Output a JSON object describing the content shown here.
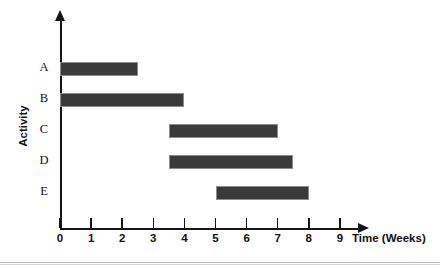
{
  "chart_data": {
    "type": "bar",
    "orientation": "horizontal",
    "subtype": "gantt",
    "title": "",
    "xlabel": "Time (Weeks)",
    "ylabel": "Activity",
    "xlim": [
      0,
      9.6
    ],
    "ylim": [
      0,
      5
    ],
    "grid": false,
    "legend": null,
    "xticks": [
      0,
      1,
      2,
      3,
      4,
      5,
      6,
      7,
      8,
      9
    ],
    "xtick_labels": [
      "0",
      "1",
      "2",
      "3",
      "4",
      "5",
      "6",
      "7",
      "8",
      "9"
    ],
    "categories": [
      "A",
      "B",
      "C",
      "D",
      "E"
    ],
    "bar_color": "#3a3a3a",
    "bar_edge_color": "#8c8c8c",
    "axis_color": "#141414",
    "tasks": [
      {
        "activity": "A",
        "start": 0,
        "end": 2.5,
        "duration": 2.5
      },
      {
        "activity": "B",
        "start": 0,
        "end": 4,
        "duration": 4
      },
      {
        "activity": "C",
        "start": 3.5,
        "end": 7,
        "duration": 3.5
      },
      {
        "activity": "D",
        "start": 3.5,
        "end": 7.5,
        "duration": 4
      },
      {
        "activity": "E",
        "start": 5,
        "end": 8,
        "duration": 3
      }
    ]
  }
}
